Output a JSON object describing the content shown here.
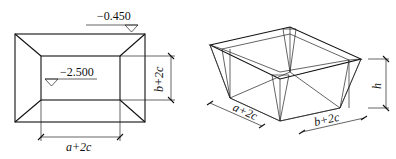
{
  "plan_view": {
    "top_elevation": "−0.450",
    "bottom_elevation": "−2.500",
    "width_dim": "a+2c",
    "height_dim": "b+2c"
  },
  "iso_view": {
    "width_dim_a": "a+2c",
    "width_dim_b": "b+2c",
    "depth_dim": "h"
  }
}
